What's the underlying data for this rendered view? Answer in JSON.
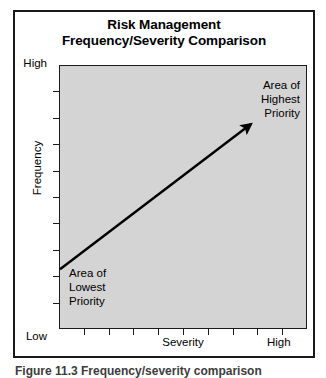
{
  "figure": {
    "caption": "Figure 11.3 Frequency/severity comparison"
  },
  "chart_data": {
    "type": "scatter",
    "title": "Risk Management Frequency/Severity Comparison",
    "title_lines": [
      "Risk Management",
      "Frequency/Severity Comparison"
    ],
    "xlabel": "Severity",
    "ylabel": "Frequency",
    "x_tick_labels": [
      "Low",
      "High"
    ],
    "y_tick_labels": [
      "Low",
      "High"
    ],
    "x_axis_low_label": "Low",
    "x_axis_high_label": "High",
    "y_axis_low_label": "Low",
    "y_axis_high_label": "High",
    "xlim": [
      0,
      10
    ],
    "ylim": [
      0,
      10
    ],
    "grid": false,
    "legend": false,
    "plot_background_color": "#d4d4d4",
    "line_color": "#000000",
    "x_tick_count": 9,
    "y_tick_count": 9,
    "annotations": [
      {
        "name": "highest-priority",
        "lines": [
          "Area of",
          "Highest",
          "Priority"
        ],
        "text": "Area of Highest Priority",
        "position": "top-right",
        "align": "right"
      },
      {
        "name": "lowest-priority",
        "lines": [
          "Area of",
          "Lowest",
          "Priority"
        ],
        "text": "Area of Lowest Priority",
        "position": "bottom-left",
        "align": "left"
      }
    ],
    "arrow": {
      "from": [
        0.0,
        2.3
      ],
      "to": [
        7.7,
        7.8
      ],
      "description": "Diagonal arrow from lower-left (low frequency, low severity) to upper-right (high frequency, high severity)",
      "head": "solid-triangle"
    }
  }
}
